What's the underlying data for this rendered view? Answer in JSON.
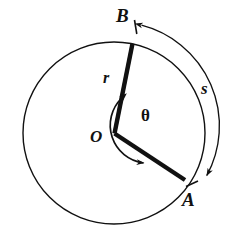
{
  "figure": {
    "background_color": "#ffffff",
    "stroke_color": "#111111",
    "circle": {
      "center_x": 114,
      "center_y": 133,
      "radius": 91,
      "stroke_width": 1.4
    },
    "center_point": {
      "name": "O",
      "x": 114,
      "y": 133
    },
    "points": [
      {
        "name": "B",
        "x": 133,
        "y": 43
      },
      {
        "name": "A",
        "x": 185,
        "y": 180
      }
    ],
    "radii": [
      {
        "from": "O",
        "to": "B",
        "stroke_width": 4.2
      },
      {
        "from": "O",
        "to": "A",
        "stroke_width": 4.2
      }
    ],
    "arc": {
      "name": "s",
      "from": "B",
      "to": "A",
      "offset_radius": 104,
      "double_headed": true,
      "stroke_width": 1.3
    },
    "angle_arc": {
      "name": "theta",
      "radius": 38,
      "double_headed": true,
      "stroke_width": 1.6
    },
    "labels": {
      "point_b": "B",
      "radius": "r",
      "arc_length": "s",
      "angle": "θ",
      "origin": "O",
      "point_a": "A"
    }
  }
}
